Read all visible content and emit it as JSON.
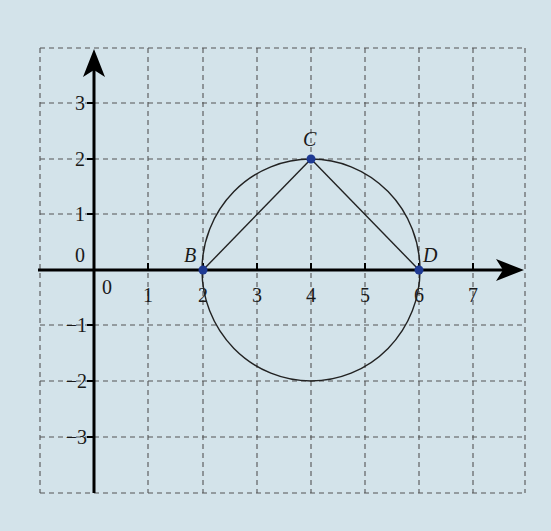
{
  "diagram": {
    "type": "coordinate-geometry",
    "background_color": "#d3e3ea",
    "point_color": "#1f3a93",
    "grid": {
      "x_range": [
        -1,
        8
      ],
      "y_range": [
        -4,
        4
      ],
      "style": "dashed"
    },
    "axes": {
      "x_ticks": [
        "0",
        "1",
        "2",
        "3",
        "4",
        "5",
        "6",
        "7"
      ],
      "y_ticks": [
        "3",
        "2",
        "1",
        "0",
        "−1",
        "−2",
        "−3"
      ],
      "origin_label_x": "0",
      "origin_label_y": "0"
    },
    "circle": {
      "center": [
        4,
        0
      ],
      "radius": 2
    },
    "points": [
      {
        "label": "B",
        "x": 2,
        "y": 0
      },
      {
        "label": "C",
        "x": 4,
        "y": 2
      },
      {
        "label": "D",
        "x": 6,
        "y": 0
      }
    ],
    "segments": [
      [
        "B",
        "C"
      ],
      [
        "C",
        "D"
      ]
    ]
  }
}
